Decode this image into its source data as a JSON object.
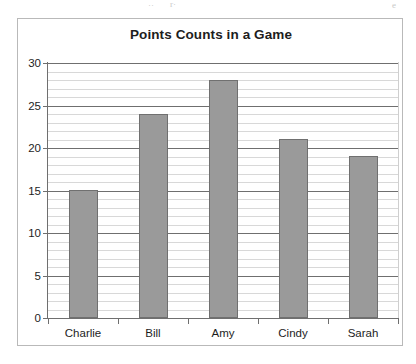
{
  "scan_artifacts": [
    {
      "text": "··",
      "class": "art-a"
    },
    {
      "text": "r·",
      "class": "art-b"
    },
    {
      "text": "e",
      "class": "art-c"
    }
  ],
  "chart_data": {
    "type": "bar",
    "title": "Points Counts in a Game",
    "xlabel": "",
    "ylabel": "",
    "categories": [
      "Charlie",
      "Bill",
      "Amy",
      "Cindy",
      "Sarah"
    ],
    "values": [
      15,
      24,
      28,
      21,
      19
    ],
    "ylim": [
      0,
      30
    ],
    "y_major_ticks": [
      0,
      5,
      10,
      15,
      20,
      25,
      30
    ],
    "y_tick_labels": [
      "0",
      "5",
      "10",
      "15",
      "20",
      "25",
      "30"
    ],
    "y_minor_step": 1,
    "grid": "horizontal",
    "legend": "none",
    "bar_color": "#9a9a9a",
    "bar_edge_color": "#707070",
    "axis_color": "#6f6f6f",
    "grid_minor_color": "#d8d8d8",
    "background_color": "#ffffff",
    "frame_color": "#b9b9b9",
    "title_color": "#1d1d1d"
  }
}
